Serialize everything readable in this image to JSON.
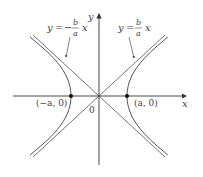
{
  "diagram": {
    "type": "hyperbola",
    "equation": "x^2/a^2 - y^2/b^2 = 1",
    "colors": {
      "background": "#ffffff",
      "axis": "#333333",
      "curve": "#555555",
      "asymptote": "#666666",
      "point": "#111111",
      "text": "#444444"
    },
    "axes": {
      "x_label": "x",
      "y_label": "y",
      "origin_label": "0"
    },
    "asymptotes": [
      {
        "name": "negative",
        "label_y": "y",
        "label_eq": "=",
        "label_sign": "−",
        "label_num": "b",
        "label_den": "a",
        "label_x": "x"
      },
      {
        "name": "positive",
        "label_y": "y",
        "label_eq": "=",
        "label_num": "b",
        "label_den": "a",
        "label_x": "x"
      }
    ],
    "vertices": [
      {
        "label": "(−a, 0)"
      },
      {
        "label": "(a, 0)"
      }
    ]
  }
}
